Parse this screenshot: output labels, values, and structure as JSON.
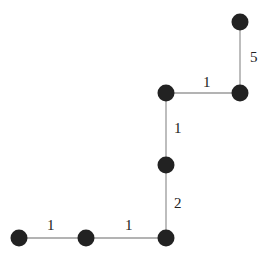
{
  "diagram": {
    "type": "weighted-graph",
    "colors": {
      "node": "#222222",
      "edge": "#9a9a9a",
      "label": "#222222"
    },
    "nodes": [
      {
        "id": "n1",
        "x": 240,
        "y": 22
      },
      {
        "id": "n2",
        "x": 240,
        "y": 93
      },
      {
        "id": "n3",
        "x": 166,
        "y": 93
      },
      {
        "id": "n4",
        "x": 166,
        "y": 165
      },
      {
        "id": "n5",
        "x": 166,
        "y": 238
      },
      {
        "id": "n6",
        "x": 86,
        "y": 238
      },
      {
        "id": "n7",
        "x": 19,
        "y": 238
      }
    ],
    "edges": [
      {
        "from": "n1",
        "to": "n2",
        "weight": "5",
        "lx": 250,
        "ly": 62
      },
      {
        "from": "n3",
        "to": "n2",
        "weight": "1",
        "lx": 203,
        "ly": 87
      },
      {
        "from": "n3",
        "to": "n4",
        "weight": "1",
        "lx": 174,
        "ly": 133
      },
      {
        "from": "n4",
        "to": "n5",
        "weight": "2",
        "lx": 174,
        "ly": 208
      },
      {
        "from": "n6",
        "to": "n5",
        "weight": "1",
        "lx": 125,
        "ly": 230
      },
      {
        "from": "n7",
        "to": "n6",
        "weight": "1",
        "lx": 47,
        "ly": 230
      }
    ]
  }
}
